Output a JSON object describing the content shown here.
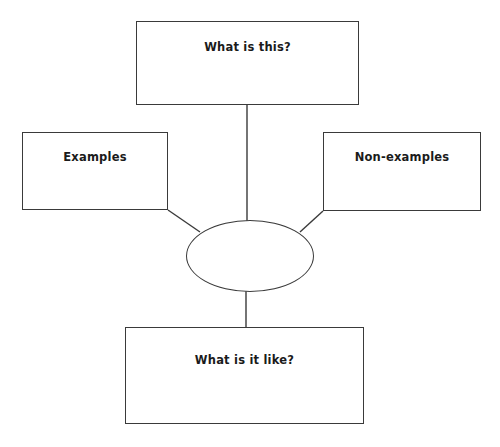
{
  "diagram": {
    "type": "concept-definition-map",
    "background_color": "#ffffff",
    "stroke_color": "#3a3a3a",
    "text_color": "#1b1b1b",
    "nodes": [
      {
        "id": "top",
        "shape": "rectangle",
        "label": "What is this?"
      },
      {
        "id": "left",
        "shape": "rectangle",
        "label": "Examples"
      },
      {
        "id": "right",
        "shape": "rectangle",
        "label": "Non-examples"
      },
      {
        "id": "center",
        "shape": "ellipse",
        "label": ""
      },
      {
        "id": "bottom",
        "shape": "rectangle",
        "label": "What is it like?"
      }
    ],
    "connectors": [
      {
        "from": "top",
        "to": "center",
        "style": "straight-vertical"
      },
      {
        "from": "left",
        "to": "center",
        "style": "diagonal"
      },
      {
        "from": "right",
        "to": "center",
        "style": "diagonal"
      },
      {
        "from": "center",
        "to": "bottom",
        "style": "straight-vertical"
      }
    ]
  }
}
